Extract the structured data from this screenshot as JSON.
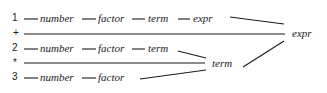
{
  "diagram": {
    "rows": [
      {
        "label": "1",
        "items": [
          "number",
          "factor",
          "term",
          "expr"
        ]
      },
      {
        "label": "+",
        "items": []
      },
      {
        "label": "2",
        "items": [
          "number",
          "factor",
          "term"
        ]
      },
      {
        "label": "*",
        "items": []
      },
      {
        "label": "3",
        "items": [
          "number",
          "factor"
        ]
      }
    ],
    "merge_nodes": {
      "term": "term",
      "expr": "expr"
    },
    "colors": {
      "line": "#1a1a1a",
      "text": "#1a1a1a",
      "background": "#ffffff"
    }
  }
}
